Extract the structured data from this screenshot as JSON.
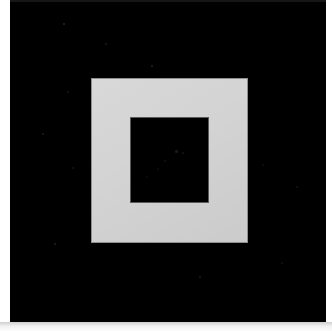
{
  "image": {
    "kind": "photograph",
    "subject": "concentric-square-target",
    "description": "Black square board with a light gray square ring and a black square hole at its center",
    "width": 332,
    "height": 331
  },
  "colors": {
    "backdrop": "#ffffff",
    "board": "#000000",
    "ring": "#d4d4d4",
    "ring_edge": "#8f8f8f",
    "inner_square": "#000000",
    "inner_square_edge": "#5a5a5a",
    "top_seam": "#15151a"
  },
  "geometry": {
    "board": {
      "x": 10,
      "y": 0,
      "width": 316,
      "height": 322
    },
    "top_seam": {
      "x": 10,
      "y": 0,
      "width": 316,
      "height": 2
    },
    "outer_square": {
      "x": 91,
      "y": 78,
      "width": 157,
      "height": 165
    },
    "inner_square": {
      "x": 130,
      "y": 117,
      "width": 79,
      "height": 86
    },
    "left_margin": {
      "x": 0,
      "y": 0,
      "width": 10,
      "height": 331
    },
    "right_margin": {
      "x": 326,
      "y": 0,
      "width": 6,
      "height": 331
    },
    "bottom_margin": {
      "x": 0,
      "y": 322,
      "width": 332,
      "height": 9
    }
  },
  "specks": [
    {
      "x": 63,
      "y": 23,
      "size": 2,
      "color": "rgba(120,120,130,0.32)"
    },
    {
      "x": 105,
      "y": 43,
      "size": 2,
      "color": "rgba(110,110,120,0.26)"
    },
    {
      "x": 151,
      "y": 65,
      "size": 2,
      "color": "rgba(125,125,135,0.30)"
    },
    {
      "x": 67,
      "y": 91,
      "size": 2,
      "color": "rgba(100,100,110,0.22)"
    },
    {
      "x": 42,
      "y": 133,
      "size": 2,
      "color": "rgba(115,115,125,0.24)"
    },
    {
      "x": 72,
      "y": 167,
      "size": 2,
      "color": "rgba(105,105,115,0.20)"
    },
    {
      "x": 54,
      "y": 243,
      "size": 2,
      "color": "rgba(120,120,130,0.26)"
    },
    {
      "x": 199,
      "y": 276,
      "size": 2,
      "color": "rgba(110,110,120,0.24)"
    },
    {
      "x": 281,
      "y": 262,
      "size": 2,
      "color": "rgba(100,100,110,0.20)"
    },
    {
      "x": 296,
      "y": 186,
      "size": 2,
      "color": "rgba(105,105,115,0.18)"
    },
    {
      "x": 262,
      "y": 164,
      "size": 2,
      "color": "rgba(95,95,105,0.16)"
    },
    {
      "x": 175,
      "y": 150,
      "size": 3,
      "color": "rgba(90,90,100,0.30)"
    },
    {
      "x": 182,
      "y": 152,
      "size": 2,
      "color": "rgba(85,85,95,0.26)"
    },
    {
      "x": 164,
      "y": 160,
      "size": 2,
      "color": "rgba(80,80,90,0.22)"
    },
    {
      "x": 157,
      "y": 168,
      "size": 2,
      "color": "rgba(75,75,85,0.18)"
    },
    {
      "x": 146,
      "y": 176,
      "size": 2,
      "color": "rgba(70,70,80,0.16)"
    }
  ]
}
